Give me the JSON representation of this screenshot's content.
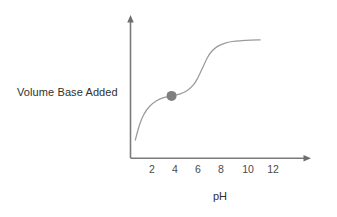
{
  "chart_data": {
    "type": "line",
    "title": "",
    "subtitle": "",
    "xlabel": "pH",
    "ylabel": "Volume Base Added",
    "xticks": [
      "2",
      "4",
      "6",
      "8",
      "10",
      "12"
    ],
    "xlim": [
      0,
      14
    ],
    "ylim": [
      0,
      1
    ],
    "grid": false,
    "legend": null,
    "legend_position": "none",
    "series": [
      {
        "name": "titration-curve",
        "color": "#9a9a9a",
        "x": [
          0.55,
          0.9,
          1.3,
          1.8,
          2.4,
          3.0,
          3.7,
          4.4,
          5.0,
          5.6,
          6.0,
          6.4,
          6.8,
          7.2,
          7.7,
          8.3,
          9.0,
          9.8,
          10.6,
          11.4
        ],
        "y": [
          0.148,
          0.27,
          0.36,
          0.425,
          0.47,
          0.495,
          0.51,
          0.525,
          0.55,
          0.6,
          0.66,
          0.74,
          0.82,
          0.875,
          0.915,
          0.94,
          0.955,
          0.962,
          0.966,
          0.968
        ]
      }
    ],
    "annotations": [
      {
        "name": "half-equivalence-point-marker",
        "type": "point",
        "x": 3.7,
        "y": 0.51,
        "color": "#7f7f7f",
        "radius": 5.0,
        "label": ""
      }
    ],
    "axes": {
      "x_axis_arrow": true,
      "y_axis_arrow": true,
      "axis_color": "#7a7a7a",
      "tick_marks": false
    }
  },
  "labels": {
    "y_axis_label": "Volume Base Added",
    "x_axis_label": "pH"
  },
  "ticks": {
    "x": [
      "2",
      "4",
      "6",
      "8",
      "10",
      "12"
    ]
  },
  "colors": {
    "background": "#ffffff",
    "axis": "#7a7a7a",
    "curve": "#9a9a9a",
    "marker": "#7f7f7f",
    "text": "#2f2f2f",
    "tick_text": "#4a4a4a"
  }
}
